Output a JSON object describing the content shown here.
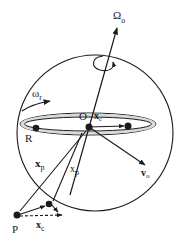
{
  "diagram": {
    "title": "",
    "colors": {
      "stroke": "#1a1a1a",
      "ring_fill": "#d9d9d9",
      "background": "#ffffff"
    },
    "labels": {
      "omega_o": "Ω",
      "omega_o_sub": "o",
      "omega_r": "ω",
      "omega_r_sub": "r",
      "O": "O",
      "x_c_top": "x",
      "x_c_top_sub": "c",
      "R": "R",
      "v_o": "v",
      "v_o_sub": "o",
      "x_p_left": "x",
      "x_p_left_sub": "p",
      "x_p_right": "x",
      "x_p_right_sub": "p",
      "P": "P",
      "x_c_bottom": "x",
      "x_c_bottom_sub": "c"
    },
    "elements": [
      {
        "id": "sphere",
        "type": "circle",
        "label": ""
      },
      {
        "id": "spin-axis",
        "type": "arrow",
        "label": "Ω_o"
      },
      {
        "id": "rotation-curl",
        "type": "curved-arrow",
        "label": ""
      },
      {
        "id": "ring",
        "type": "ellipse",
        "label": "ω_r"
      },
      {
        "id": "point-O",
        "type": "point",
        "label": "O"
      },
      {
        "id": "point-R",
        "type": "point",
        "label": "R"
      },
      {
        "id": "point-ring-right",
        "type": "point",
        "label": ""
      },
      {
        "id": "point-P",
        "type": "point",
        "label": "P"
      },
      {
        "id": "vector-xc-top",
        "type": "arrow",
        "label": "x_c"
      },
      {
        "id": "vector-vo",
        "type": "arrow",
        "label": "v_o"
      },
      {
        "id": "vector-xp-left",
        "type": "arrow",
        "label": "x_p"
      },
      {
        "id": "vector-xp-right",
        "type": "arrow",
        "label": "x_p"
      },
      {
        "id": "vector-xc-bottom",
        "type": "dashed-arrow",
        "label": "x_c"
      }
    ]
  }
}
